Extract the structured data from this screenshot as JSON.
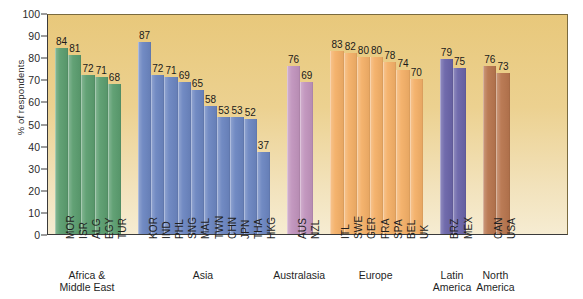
{
  "chart_data": {
    "type": "bar",
    "title": "",
    "xlabel": "",
    "ylabel": "% of respondents",
    "ylim": [
      0,
      100
    ],
    "ytick_step": 10,
    "yticks": [
      100,
      90,
      80,
      70,
      60,
      50,
      40,
      30,
      20,
      10,
      0
    ],
    "grid": false,
    "legend": "none",
    "categories": [
      "MOR",
      "ISR",
      "ALG",
      "EGY",
      "TUR",
      "KOR",
      "IND",
      "PHL",
      "SNG",
      "MAL",
      "TWN",
      "CHN",
      "JPN",
      "THA",
      "HKG",
      "AUS",
      "NZL",
      "ITL",
      "SWE",
      "GER",
      "FRA",
      "SPA",
      "BEL",
      "UK",
      "BRZ",
      "MEX",
      "CAN",
      "USA"
    ],
    "values": [
      84,
      81,
      72,
      71,
      68,
      87,
      72,
      71,
      69,
      65,
      58,
      53,
      53,
      52,
      37,
      76,
      69,
      83,
      82,
      80,
      80,
      78,
      74,
      70,
      79,
      75,
      76,
      73
    ],
    "groups": [
      {
        "name": "Africa &\nMiddle East",
        "color": "#5c9e70",
        "bars": [
          {
            "label": "MOR",
            "value": 84
          },
          {
            "label": "ISR",
            "value": 81
          },
          {
            "label": "ALG",
            "value": 72
          },
          {
            "label": "EGY",
            "value": 71
          },
          {
            "label": "TUR",
            "value": 68
          }
        ]
      },
      {
        "name": "Asia",
        "color": "#6c86c1",
        "bars": [
          {
            "label": "KOR",
            "value": 87
          },
          {
            "label": "IND",
            "value": 72
          },
          {
            "label": "PHL",
            "value": 71
          },
          {
            "label": "SNG",
            "value": 69
          },
          {
            "label": "MAL",
            "value": 65
          },
          {
            "label": "TWN",
            "value": 58
          },
          {
            "label": "CHN",
            "value": 53
          },
          {
            "label": "JPN",
            "value": 53
          },
          {
            "label": "THA",
            "value": 52
          },
          {
            "label": "HKG",
            "value": 37
          }
        ]
      },
      {
        "name": "Australasia",
        "color": "#c194bd",
        "bars": [
          {
            "label": "AUS",
            "value": 76
          },
          {
            "label": "NZL",
            "value": 69
          }
        ]
      },
      {
        "name": "Europe",
        "color": "#f4b068",
        "bars": [
          {
            "label": "ITL",
            "value": 83
          },
          {
            "label": "SWE",
            "value": 82
          },
          {
            "label": "GER",
            "value": 80
          },
          {
            "label": "FRA",
            "value": 80
          },
          {
            "label": "SPA",
            "value": 78
          },
          {
            "label": "BEL",
            "value": 74
          },
          {
            "label": "UK",
            "value": 70
          }
        ]
      },
      {
        "name": "Latin\nAmerica",
        "color": "#6b65a9",
        "bars": [
          {
            "label": "BRZ",
            "value": 79
          },
          {
            "label": "MEX",
            "value": 75
          }
        ]
      },
      {
        "name": "North\nAmerica",
        "color": "#b8764f",
        "bars": [
          {
            "label": "CAN",
            "value": 76
          },
          {
            "label": "USA",
            "value": 73
          }
        ]
      }
    ]
  },
  "axis": {
    "y_title": "% of respondents"
  },
  "colors": {
    "plot_background_top": "#e8c87b",
    "plot_background_bottom": "#f6ecd2",
    "axis_line": "#3a3a3a",
    "text": "#1f1f1f"
  }
}
